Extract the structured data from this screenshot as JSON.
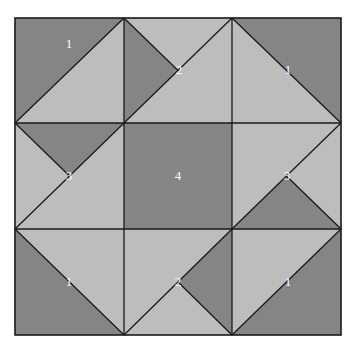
{
  "diagram": {
    "type": "quilt-block",
    "grid": "3x3",
    "colors": {
      "dark": "#858585",
      "light": "#bdbdbd",
      "line": "#1a1a1a",
      "label": "#ffffff"
    },
    "cells": [
      {
        "row": 0,
        "col": 0,
        "label": "1",
        "pattern": "half-square, dark top-left"
      },
      {
        "row": 0,
        "col": 1,
        "label": "2",
        "pattern": "quarter-triangle dark left"
      },
      {
        "row": 0,
        "col": 2,
        "label": "1",
        "pattern": "half-square, dark top-right"
      },
      {
        "row": 1,
        "col": 0,
        "label": "3",
        "pattern": "quarter-triangle dark top"
      },
      {
        "row": 1,
        "col": 1,
        "label": "4",
        "pattern": "solid dark square"
      },
      {
        "row": 1,
        "col": 2,
        "label": "3",
        "pattern": "quarter-triangle dark bottom"
      },
      {
        "row": 2,
        "col": 0,
        "label": "1",
        "pattern": "half-square, dark bottom-left"
      },
      {
        "row": 2,
        "col": 1,
        "label": "2",
        "pattern": "quarter-triangle dark right"
      },
      {
        "row": 2,
        "col": 2,
        "label": "1",
        "pattern": "half-square, dark bottom-right"
      }
    ]
  }
}
